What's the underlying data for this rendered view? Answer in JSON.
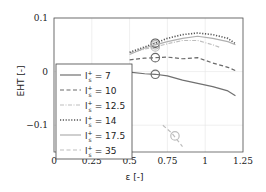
{
  "chart_data": {
    "type": "line",
    "title": "",
    "xlabel": "ε [-]",
    "ylabel": "EHT [-]",
    "xlim": [
      0,
      1.25
    ],
    "ylim": [
      -0.15,
      0.1
    ],
    "grid": true,
    "legend_position": "lower left (inside)",
    "x_ticks": [
      "0",
      "0.25",
      "0.5",
      "0.75",
      "1",
      "1.25"
    ],
    "y_ticks": [
      "0.1",
      "0",
      "−0.1"
    ],
    "series": [
      {
        "name": "l_s^+ = 7",
        "label_base": "l",
        "label_sup": "+",
        "label_sub": "s",
        "label_value": "= 7",
        "style": "solid",
        "color": "#707070",
        "x": [
          0.5,
          0.6,
          0.67,
          0.75,
          0.85,
          0.95,
          1.05,
          1.15,
          1.2
        ],
        "y": [
          -0.001,
          -0.004,
          -0.005,
          -0.008,
          -0.016,
          -0.022,
          -0.028,
          -0.036,
          -0.045
        ],
        "marker": {
          "x": 0.67,
          "y": -0.005
        }
      },
      {
        "name": "l_s^+ = 10",
        "label_base": "l",
        "label_sup": "+",
        "label_sub": "s",
        "label_value": "= 10",
        "style": "dashed",
        "color": "#6a6a6a",
        "x": [
          0.5,
          0.6,
          0.67,
          0.75,
          0.85,
          0.95,
          1.05,
          1.15,
          1.2
        ],
        "y": [
          0.022,
          0.025,
          0.026,
          0.027,
          0.024,
          0.026,
          0.016,
          0.008,
          0.002
        ],
        "marker": {
          "x": 0.67,
          "y": 0.026
        }
      },
      {
        "name": "l_s^+ = 12.5",
        "label_base": "l",
        "label_sup": "+",
        "label_sub": "s",
        "label_value": "= 12.5",
        "style": "dashdot",
        "color": "#bdbdbd",
        "x": [
          0.5,
          0.6,
          0.67,
          0.75,
          0.85,
          0.95,
          1.05,
          1.1
        ],
        "y": [
          0.035,
          0.042,
          0.046,
          0.052,
          0.058,
          0.058,
          0.05,
          0.045
        ],
        "marker": {
          "x": 0.67,
          "y": 0.046
        }
      },
      {
        "name": "l_s^+ = 14",
        "label_base": "l",
        "label_sup": "+",
        "label_sub": "s",
        "label_value": "= 14",
        "style": "dotted",
        "color": "#555555",
        "x": [
          0.5,
          0.6,
          0.67,
          0.75,
          0.85,
          0.95,
          1.05,
          1.15,
          1.2
        ],
        "y": [
          0.036,
          0.046,
          0.053,
          0.062,
          0.069,
          0.072,
          0.069,
          0.062,
          0.052
        ],
        "marker": {
          "x": 0.67,
          "y": 0.053
        }
      },
      {
        "name": "l_s^+ = 17.5",
        "label_base": "l",
        "label_sup": "+",
        "label_sub": "s",
        "label_value": "= 17.5",
        "style": "solid",
        "color": "#b0b0b0",
        "x": [
          0.5,
          0.6,
          0.67,
          0.75,
          0.85,
          0.95,
          1.05,
          1.15,
          1.2
        ],
        "y": [
          0.032,
          0.044,
          0.05,
          0.056,
          0.062,
          0.066,
          0.062,
          0.056,
          0.05
        ],
        "marker": {
          "x": 0.67,
          "y": 0.05
        }
      },
      {
        "name": "l_s^+ = 35",
        "label_base": "l",
        "label_sup": "+",
        "label_sub": "s",
        "label_value": "= 35",
        "style": "dashed",
        "color": "#bdbdbd",
        "x": [
          0.72,
          0.78,
          0.85
        ],
        "y": [
          -0.1,
          -0.115,
          -0.14
        ],
        "marker": {
          "x": 0.8,
          "y": -0.12
        }
      }
    ]
  }
}
